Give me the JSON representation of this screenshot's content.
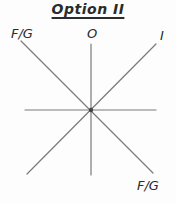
{
  "title": {
    "text": "Option II"
  },
  "diagram": {
    "colors": {
      "background": "#fdfdfd",
      "line": "#7a7a7a",
      "dot": "#454545",
      "text": "#2b2b2b"
    },
    "labels": {
      "fg_top_left": "F/G",
      "o_top": "O",
      "i_top_right": "I",
      "fg_bottom_right": "F/G"
    },
    "lines": [
      {
        "name": "fg-axis-diagonal",
        "x1": 21,
        "y1": 41,
        "x2": 153,
        "y2": 173
      },
      {
        "name": "i-axis-diagonal",
        "x1": 156,
        "y1": 44,
        "x2": 27,
        "y2": 174
      },
      {
        "name": "o-axis-vertical",
        "x1": 91,
        "y1": 44,
        "x2": 91,
        "y2": 175
      },
      {
        "name": "horizontal-axis",
        "x1": 25,
        "y1": 110,
        "x2": 156,
        "y2": 110
      }
    ],
    "center_dot": {
      "cx": 91,
      "cy": 110,
      "r": 2.2
    }
  }
}
